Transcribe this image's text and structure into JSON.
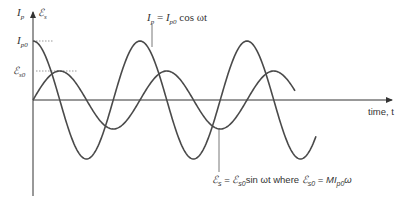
{
  "diagram": {
    "axes": {
      "y_label_primary": {
        "symbol": "I",
        "sub": "p"
      },
      "y_label_secondary": {
        "symbol": "ℰ",
        "sub": "s"
      },
      "x_label": "time, t",
      "y_ticks": [
        {
          "symbol": "I",
          "sub": "p0",
          "y": 41
        },
        {
          "symbol": "ℰ",
          "sub": "s0",
          "y": 71
        }
      ]
    },
    "curves": [
      {
        "name": "primary-current",
        "label": {
          "lhs": "I",
          "lhs_sub": "p",
          "eq": " = ",
          "rhs": "I",
          "rhs_sub": "p0",
          "tail": " cos ωt"
        },
        "function": "cos",
        "amplitude_px": 59,
        "period_px": 107,
        "x_start": 33,
        "x_end": 316
      },
      {
        "name": "secondary-emf",
        "label": {
          "lhs": "ℰ",
          "lhs_sub": "s",
          "eq": " = ",
          "rhs": "ℰ",
          "rhs_sub": "s0",
          "tail": "sin ωt where ",
          "lhs2": "ℰ",
          "lhs2_sub": "s0",
          "eq2": " = ",
          "tail2": "MI",
          "tail2_sub": "p0",
          "tail3": "ω"
        },
        "function": "sin",
        "amplitude_px": 29,
        "period_px": 107,
        "x_start": 33,
        "x_end": 295
      }
    ],
    "colors": {
      "curve": "#4a4a4a",
      "axis": "#333333",
      "guide": "#999999",
      "text": "#333333"
    }
  }
}
